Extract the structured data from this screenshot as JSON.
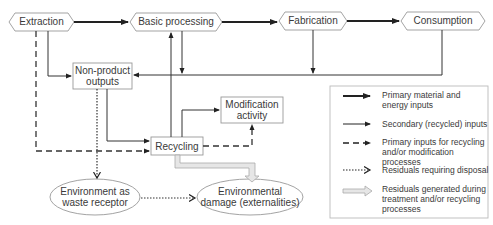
{
  "nodes": {
    "extraction": "Extraction",
    "basic_processing": "Basic processing",
    "fabrication": "Fabrication",
    "consumption": "Consumption",
    "non_product_1": "Non-product",
    "non_product_2": "outputs",
    "modification_1": "Modification",
    "modification_2": "activity",
    "recycling": "Recycling",
    "env_receptor_1": "Environment as",
    "env_receptor_2": "waste receptor",
    "env_damage_1": "Environmental",
    "env_damage_2": "damage (externalities)"
  },
  "legend": {
    "items": [
      {
        "line1": "Primary material and",
        "line2": "energy inputs",
        "line3": "",
        "style": "thick-solid"
      },
      {
        "line1": "Secondary (recycled) inputs",
        "line2": "",
        "line3": "",
        "style": "thin-solid"
      },
      {
        "line1": "Primary inputs for recycling",
        "line2": "and/or modification processes",
        "line3": "",
        "style": "dashed"
      },
      {
        "line1": "Residuals requiring disposal",
        "line2": "",
        "line3": "",
        "style": "dotted"
      },
      {
        "line1": "Residuals generated during",
        "line2": "treatment and/or recycling",
        "line3": "processes",
        "style": "hollow"
      }
    ]
  },
  "colors": {
    "line": "#333333",
    "node_border": "#999999",
    "hollow_arrow": "#bbbbbb"
  }
}
